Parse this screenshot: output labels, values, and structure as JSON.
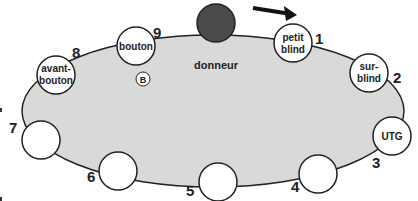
{
  "diagram": {
    "type": "poker-table-positions",
    "colors": {
      "table_fill": "#d9d9d9",
      "outline": "#222222",
      "seat_fill": "#ffffff",
      "dealer_fill": "#4a4a4a"
    },
    "dealer": {
      "label": "donneur"
    },
    "button_marker": {
      "label": "B"
    },
    "direction_arrow": "arrow-right",
    "seats": [
      {
        "number": "1",
        "label_line1": "petit",
        "label_line2": "blind"
      },
      {
        "number": "2",
        "label_line1": "sur-",
        "label_line2": "blind"
      },
      {
        "number": "3",
        "label_line1": "UTG",
        "label_line2": ""
      },
      {
        "number": "4",
        "label_line1": "",
        "label_line2": ""
      },
      {
        "number": "5",
        "label_line1": "",
        "label_line2": ""
      },
      {
        "number": "6",
        "label_line1": "",
        "label_line2": ""
      },
      {
        "number": "7",
        "label_line1": "",
        "label_line2": ""
      },
      {
        "number": "8",
        "label_line1": "avant-",
        "label_line2": "bouton"
      },
      {
        "number": "9",
        "label_line1": "bouton",
        "label_line2": ""
      }
    ]
  }
}
